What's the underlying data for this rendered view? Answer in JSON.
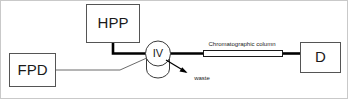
{
  "diagram": {
    "type": "flow-schematic",
    "title_visible": false,
    "background_color": "#ffffff",
    "border_color": "#c9c9c9",
    "line_color": "#000000",
    "box_stroke_color": "#555555",
    "nodes": [
      {
        "id": "fpd",
        "label": "FPD",
        "shape": "rectangle"
      },
      {
        "id": "hpp",
        "label": "HPP",
        "shape": "rectangle"
      },
      {
        "id": "iv",
        "label": "IV",
        "shape": "circle-on-cylinder"
      },
      {
        "id": "column",
        "label": "Chromatographic column",
        "shape": "thin-rectangle"
      },
      {
        "id": "d",
        "label": "D",
        "shape": "rectangle"
      }
    ],
    "annotations": [
      {
        "id": "waste",
        "label": "waste",
        "arrow": "down-right"
      }
    ],
    "connections": [
      {
        "from": "hpp",
        "to": "iv",
        "style": "thick"
      },
      {
        "from": "fpd",
        "to": "iv",
        "style": "thin"
      },
      {
        "from": "iv",
        "to": "column",
        "style": "thick"
      },
      {
        "from": "column",
        "to": "d",
        "style": "thick"
      },
      {
        "from": "iv",
        "to": "waste",
        "style": "arrow"
      }
    ]
  }
}
